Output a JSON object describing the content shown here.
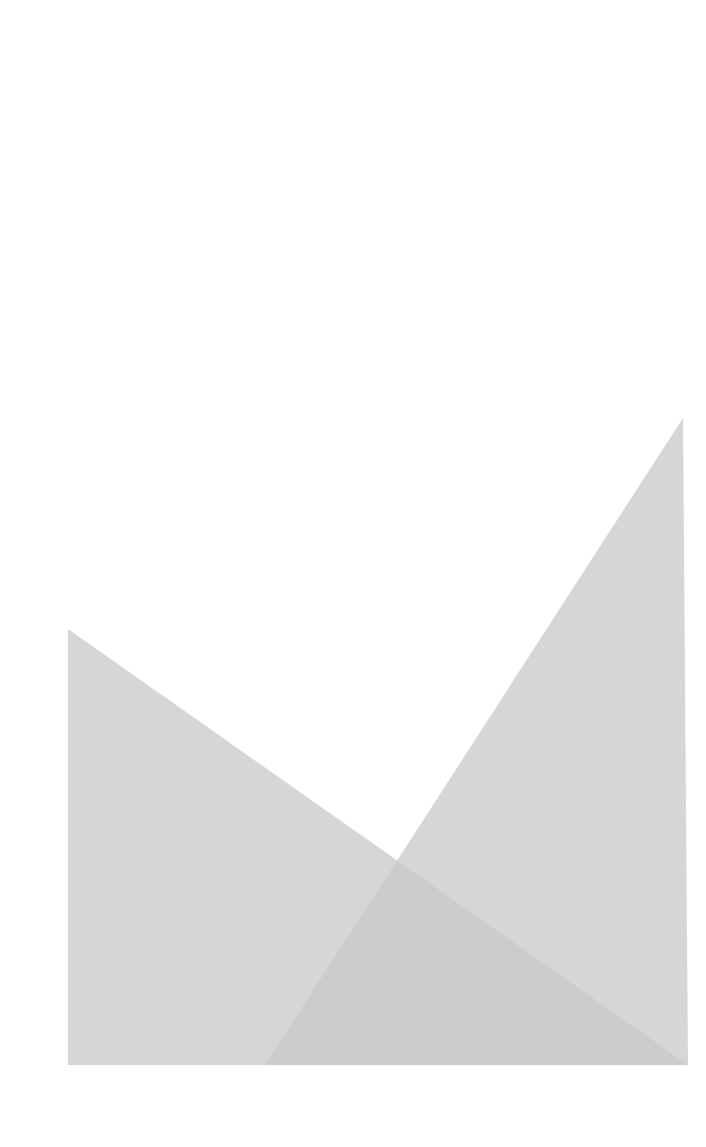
{
  "canvas": {
    "width": 706,
    "height": 1147,
    "background": "#ffffff"
  },
  "shapes": [
    {
      "name": "left-triangle",
      "points": "68,629 68,1065 688,1065",
      "fill": "#c8c8c8",
      "opacity": 0.75
    },
    {
      "name": "right-triangle",
      "points": "683,418 688,1065 265,1065",
      "fill": "#c8c8c8",
      "opacity": 0.75
    }
  ]
}
